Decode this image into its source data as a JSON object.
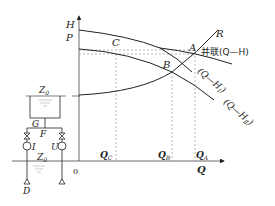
{
  "diagram": {
    "type": "pump parallel operation characteristic",
    "axes": {
      "y_label_top": "H",
      "y_label_bottom": "P",
      "x_label": "Q",
      "origin": "0"
    },
    "curves": {
      "parallel": "并联(Q—H)",
      "pump1": "(Q—H",
      "pump1_sub": "Ⅰ",
      "pump2": "(Q—H",
      "pump2_sub": "Ⅱ",
      "system": "R"
    },
    "points": {
      "a": "A",
      "b": "B",
      "c": "C"
    },
    "x_ticks": [
      {
        "main": "Q",
        "sub": "C"
      },
      {
        "main": "Q",
        "sub": "B"
      },
      {
        "main": "Q",
        "sub": "A"
      }
    ],
    "schematic": {
      "tank_level": "Z",
      "tank_level_sub": "0",
      "node_g": "G",
      "node_f": "F",
      "pump_i": "I",
      "pump_u": "U",
      "suction_level": "Z",
      "suction_level_sub": "0",
      "node_d": "D"
    },
    "colors": {
      "line": "#222222",
      "dashed": "#888888",
      "background": "#ffffff"
    }
  }
}
